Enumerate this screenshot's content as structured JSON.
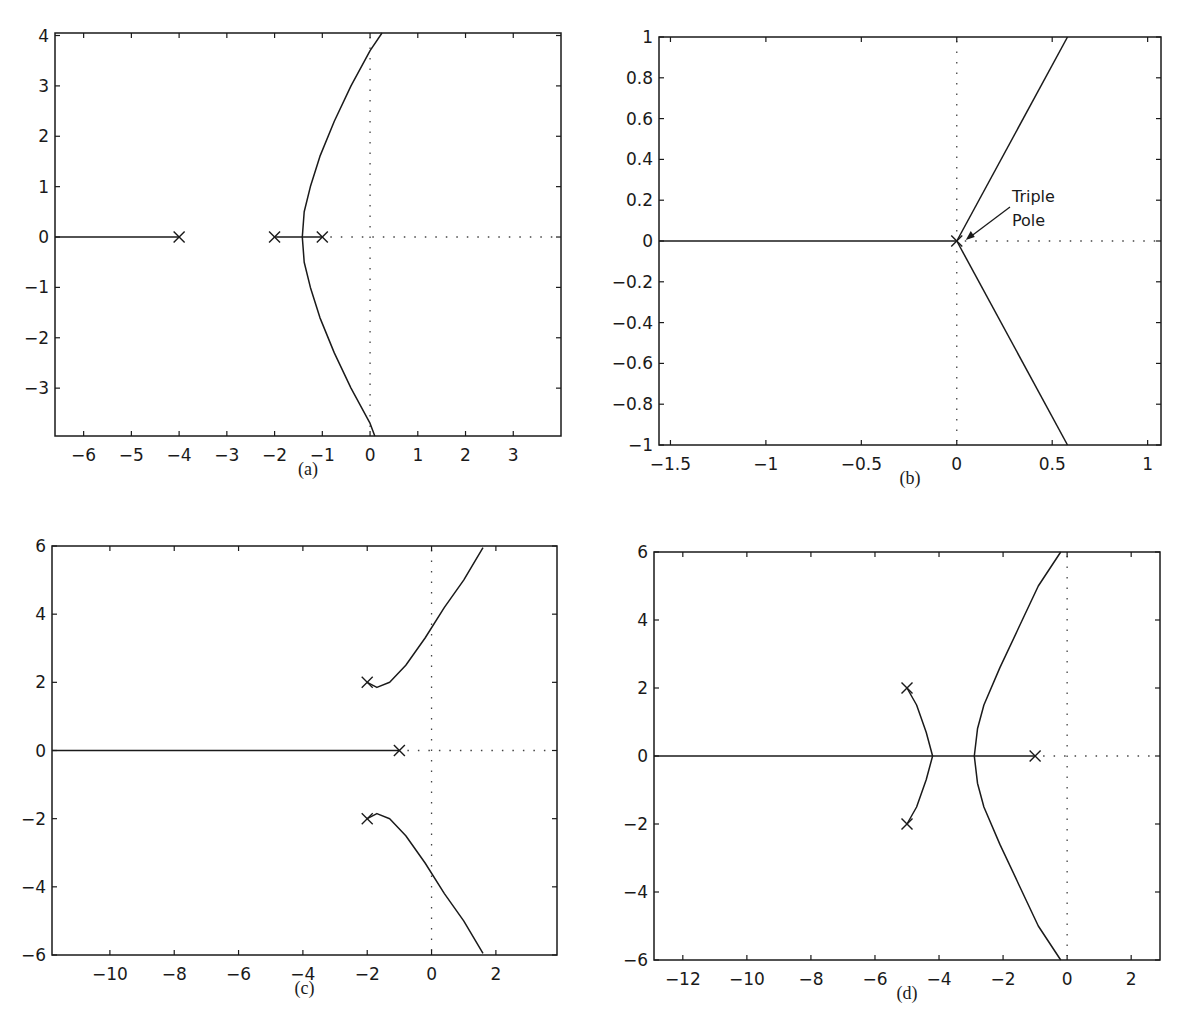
{
  "chart_data": [
    {
      "id": "a",
      "type": "line",
      "caption": "(a)",
      "title": "",
      "xlabel": "",
      "ylabel": "",
      "xlim": [
        -6.6,
        4.0
      ],
      "ylim": [
        -3.95,
        4.05
      ],
      "xticks": [
        -6,
        -5,
        -4,
        -3,
        -2,
        -1,
        0,
        1,
        2,
        3
      ],
      "xtick_labels": [
        "−6",
        "−5",
        "−4",
        "−3",
        "−2",
        "−1",
        "0",
        "1",
        "2",
        "3"
      ],
      "yticks": [
        -3,
        -2,
        -1,
        0,
        1,
        2,
        3,
        4
      ],
      "ytick_labels": [
        "−3",
        "−2",
        "−1",
        "0",
        "1",
        "2",
        "3",
        "4"
      ],
      "grid": false,
      "poles": [
        [
          -4,
          0
        ],
        [
          -2,
          0
        ],
        [
          -1,
          0
        ]
      ],
      "series": [
        {
          "name": "real-axis branch left",
          "x": [
            -6.6,
            -4
          ],
          "y": [
            0,
            0
          ]
        },
        {
          "name": "real-axis segment",
          "x": [
            -2,
            -1
          ],
          "y": [
            0,
            0
          ]
        },
        {
          "name": "upper branch",
          "x": [
            -1.42,
            -1.38,
            -1.25,
            -1.05,
            -0.75,
            -0.4,
            0.0,
            0.25
          ],
          "y": [
            0,
            0.5,
            1.0,
            1.6,
            2.3,
            3.0,
            3.7,
            4.05
          ]
        },
        {
          "name": "lower branch",
          "x": [
            -1.42,
            -1.38,
            -1.25,
            -1.05,
            -0.75,
            -0.4,
            0.0,
            0.1
          ],
          "y": [
            0,
            -0.5,
            -1.0,
            -1.6,
            -2.3,
            -3.0,
            -3.7,
            -3.95
          ]
        }
      ]
    },
    {
      "id": "b",
      "type": "line",
      "caption": "(b)",
      "title": "",
      "xlabel": "",
      "ylabel": "",
      "xlim": [
        -1.56,
        1.07
      ],
      "ylim": [
        -1.0,
        1.0
      ],
      "xticks": [
        -1.5,
        -1,
        -0.5,
        0,
        0.5,
        1
      ],
      "xtick_labels": [
        "−1.5",
        "−1",
        "−0.5",
        "0",
        "0.5",
        "1"
      ],
      "yticks": [
        -1,
        -0.8,
        -0.6,
        -0.4,
        -0.2,
        0,
        0.2,
        0.4,
        0.6,
        0.8,
        1
      ],
      "ytick_labels": [
        "−1",
        "−0.8",
        "−0.6",
        "−0.4",
        "−0.2",
        "0",
        "0.2",
        "0.4",
        "0.6",
        "0.8",
        "1"
      ],
      "grid": false,
      "poles": [
        [
          0,
          0
        ]
      ],
      "annotation": {
        "text_line1": "Triple",
        "text_line2": "Pole",
        "points_to": [
          0,
          0
        ]
      },
      "series": [
        {
          "name": "real-axis branch",
          "x": [
            -1.56,
            0
          ],
          "y": [
            0,
            0
          ]
        },
        {
          "name": "upper asymptote",
          "x": [
            0,
            0.58
          ],
          "y": [
            0,
            1.0
          ]
        },
        {
          "name": "lower asymptote",
          "x": [
            0,
            0.58
          ],
          "y": [
            0,
            -1.0
          ]
        }
      ]
    },
    {
      "id": "c",
      "type": "line",
      "caption": "(c)",
      "title": "",
      "xlabel": "",
      "ylabel": "",
      "xlim": [
        -11.8,
        3.9
      ],
      "ylim": [
        -6,
        6
      ],
      "xticks": [
        -10,
        -8,
        -6,
        -4,
        -2,
        0,
        2
      ],
      "xtick_labels": [
        "−10",
        "−8",
        "−6",
        "−4",
        "−2",
        "0",
        "2"
      ],
      "yticks": [
        -6,
        -4,
        -2,
        0,
        2,
        4,
        6
      ],
      "ytick_labels": [
        "−6",
        "−4",
        "−2",
        "0",
        "2",
        "4",
        "6"
      ],
      "grid": false,
      "poles": [
        [
          -1,
          0
        ],
        [
          -2,
          2
        ],
        [
          -2,
          -2
        ]
      ],
      "series": [
        {
          "name": "real-axis branch",
          "x": [
            -11.8,
            -1
          ],
          "y": [
            0,
            0
          ]
        },
        {
          "name": "upper branch",
          "x": [
            -2,
            -1.7,
            -1.3,
            -0.8,
            -0.2,
            0.4,
            1.0,
            1.6
          ],
          "y": [
            2,
            1.85,
            2.0,
            2.5,
            3.3,
            4.2,
            5.0,
            5.95
          ]
        },
        {
          "name": "lower branch",
          "x": [
            -2,
            -1.7,
            -1.3,
            -0.8,
            -0.2,
            0.4,
            1.0,
            1.6
          ],
          "y": [
            -2,
            -1.85,
            -2.0,
            -2.5,
            -3.3,
            -4.2,
            -5.0,
            -5.95
          ]
        }
      ]
    },
    {
      "id": "d",
      "type": "line",
      "caption": "(d)",
      "title": "",
      "xlabel": "",
      "ylabel": "",
      "xlim": [
        -12.9,
        2.9
      ],
      "ylim": [
        -6,
        6
      ],
      "xticks": [
        -12,
        -10,
        -8,
        -6,
        -4,
        -2,
        0,
        2
      ],
      "xtick_labels": [
        "−12",
        "−10",
        "−8",
        "−6",
        "−4",
        "−2",
        "0",
        "2"
      ],
      "yticks": [
        -6,
        -4,
        -2,
        0,
        2,
        4,
        6
      ],
      "ytick_labels": [
        "−6",
        "−4",
        "−2",
        "0",
        "2",
        "4",
        "6"
      ],
      "grid": false,
      "poles": [
        [
          -1,
          0
        ],
        [
          -5,
          2
        ],
        [
          -5,
          -2
        ]
      ],
      "series": [
        {
          "name": "real-axis branch",
          "x": [
            -12.9,
            -1
          ],
          "y": [
            0,
            0
          ]
        },
        {
          "name": "complex pole branch upper",
          "x": [
            -5,
            -4.7,
            -4.4,
            -4.2
          ],
          "y": [
            2,
            1.5,
            0.7,
            0
          ]
        },
        {
          "name": "complex pole branch lower",
          "x": [
            -5,
            -4.7,
            -4.4,
            -4.2
          ],
          "y": [
            -2,
            -1.5,
            -0.7,
            0
          ]
        },
        {
          "name": "upper asymptote",
          "x": [
            -2.9,
            -2.8,
            -2.6,
            -2.1,
            -1.5,
            -0.9,
            -0.2
          ],
          "y": [
            0,
            0.8,
            1.5,
            2.6,
            3.8,
            5.0,
            6.0
          ]
        },
        {
          "name": "lower asymptote",
          "x": [
            -2.9,
            -2.8,
            -2.6,
            -2.1,
            -1.5,
            -0.9,
            -0.2
          ],
          "y": [
            0,
            -0.8,
            -1.5,
            -2.6,
            -3.8,
            -5.0,
            -6.0
          ]
        }
      ]
    }
  ]
}
